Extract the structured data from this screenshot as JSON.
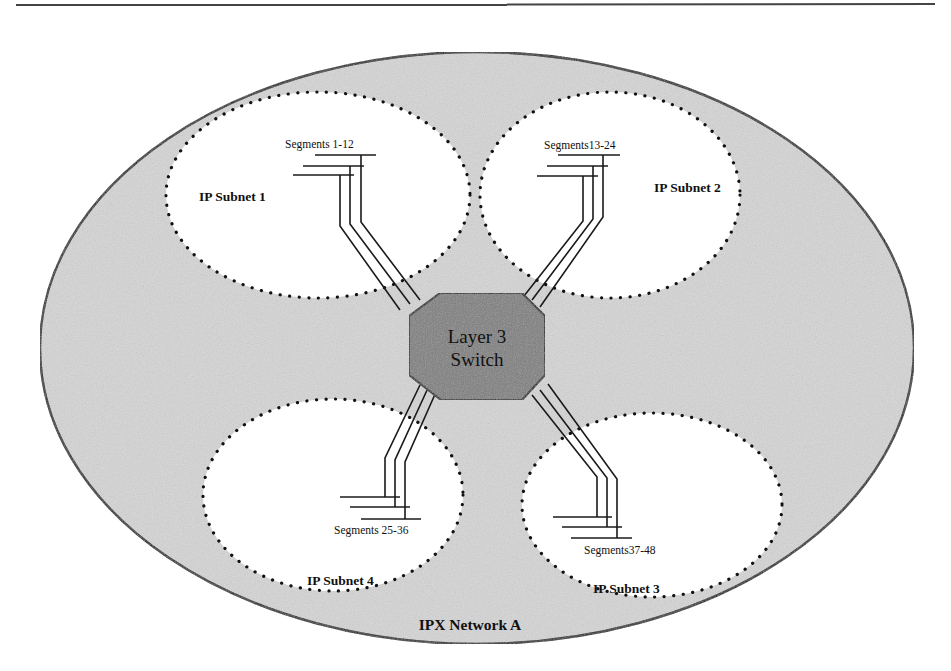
{
  "diagram": {
    "network": {
      "label": "IPX Network A",
      "fill": "#d4d4d4"
    },
    "switch": {
      "line1": "Layer 3",
      "line2": "Switch",
      "fill": "#7a7a7a"
    },
    "subnets": [
      {
        "label": "IP Subnet 1",
        "segments": "Segments 1-12"
      },
      {
        "label": "IP Subnet 2",
        "segments": "Segments13-24"
      },
      {
        "label": "IP Subnet 3",
        "segments": "Segments37-48"
      },
      {
        "label": "IP Subnet 4",
        "segments": "Segments 25-36"
      }
    ]
  }
}
